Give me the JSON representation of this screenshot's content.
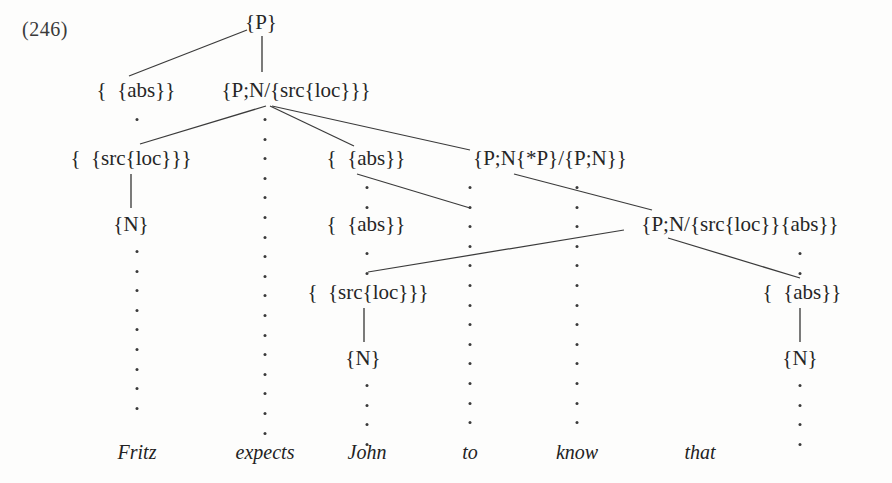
{
  "example": {
    "number": "(246)"
  },
  "sentence": {
    "words": [
      {
        "text": "Fritz",
        "x": 137,
        "y": 452
      },
      {
        "text": "expects",
        "x": 265,
        "y": 452
      },
      {
        "text": "John",
        "x": 367,
        "y": 452
      },
      {
        "text": "to",
        "x": 470,
        "y": 452
      },
      {
        "text": "know",
        "x": 577,
        "y": 452
      },
      {
        "text": "that",
        "x": 700,
        "y": 452
      }
    ]
  },
  "tree": {
    "nodes": [
      {
        "id": "n-root-p",
        "label": "{P}",
        "x": 261,
        "y": 22
      },
      {
        "id": "n-fritz-abs",
        "label": "{  {abs}}",
        "x": 136,
        "y": 90
      },
      {
        "id": "n-pn-srcloc",
        "label": "{P;N/{src{loc}}}",
        "x": 296,
        "y": 90
      },
      {
        "id": "n-fritz-srcloc",
        "label": "{  {src{loc}}}",
        "x": 131,
        "y": 158
      },
      {
        "id": "n-john-abs-1",
        "label": "{  {abs}}",
        "x": 366,
        "y": 158
      },
      {
        "id": "n-pn-starp",
        "label": "{P;N{*P}/{P;N}}",
        "x": 550,
        "y": 158
      },
      {
        "id": "n-fritz-n",
        "label": "{N}",
        "x": 131,
        "y": 224
      },
      {
        "id": "n-john-abs-2",
        "label": "{  {abs}}",
        "x": 366,
        "y": 224
      },
      {
        "id": "n-pn-srcloc-abs",
        "label": "{P;N/{src{loc}}{abs}}",
        "x": 740,
        "y": 224
      },
      {
        "id": "n-john-srcloc",
        "label": "{  {src{loc}}}",
        "x": 368,
        "y": 292
      },
      {
        "id": "n-that-abs",
        "label": "{  {abs}}",
        "x": 802,
        "y": 292
      },
      {
        "id": "n-john-n",
        "label": "{N}",
        "x": 363,
        "y": 358
      },
      {
        "id": "n-that-n",
        "label": "{N}",
        "x": 800,
        "y": 358
      }
    ],
    "edges": [
      {
        "id": "e-root-to-fritz-abs",
        "x1": 247,
        "y1": 30,
        "x2": 129,
        "y2": 76,
        "kind": "diagonal"
      },
      {
        "id": "e-root-to-pn-srcloc",
        "x1": 262,
        "y1": 36,
        "x2": 262,
        "y2": 72,
        "kind": "vertical"
      },
      {
        "id": "e-pnsrc-to-fritz-srcloc",
        "x1": 266,
        "y1": 106,
        "x2": 140,
        "y2": 144,
        "kind": "diagonal"
      },
      {
        "id": "e-pnsrc-to-john-abs",
        "x1": 270,
        "y1": 106,
        "x2": 354,
        "y2": 146,
        "kind": "diagonal"
      },
      {
        "id": "e-pnsrc-to-pn-starp",
        "x1": 272,
        "y1": 106,
        "x2": 470,
        "y2": 150,
        "kind": "diagonal"
      },
      {
        "id": "e-fritzsrc-to-fritz-n",
        "x1": 131,
        "y1": 174,
        "x2": 131,
        "y2": 208,
        "kind": "vertical"
      },
      {
        "id": "e-johnabs1-to-johnabs2",
        "x1": 357,
        "y1": 174,
        "x2": 470,
        "y2": 208,
        "kind": "diagonal"
      },
      {
        "id": "e-pnstarp-to-pnsrcabs",
        "x1": 514,
        "y1": 174,
        "x2": 652,
        "y2": 210,
        "kind": "diagonal"
      },
      {
        "id": "e-johnabs2-to-pnsrcabs",
        "x1": 368,
        "y1": 272,
        "x2": 624,
        "y2": 230,
        "kind": "diagonal"
      },
      {
        "id": "e-pnsrcabs-to-that-abs",
        "x1": 668,
        "y1": 238,
        "x2": 800,
        "y2": 278,
        "kind": "diagonal"
      },
      {
        "id": "e-johnsrc-to-john-n",
        "x1": 364,
        "y1": 308,
        "x2": 364,
        "y2": 342,
        "kind": "vertical"
      },
      {
        "id": "e-thatabs-to-that-n",
        "x1": 800,
        "y1": 308,
        "x2": 800,
        "y2": 342,
        "kind": "vertical"
      }
    ],
    "dotted_columns": [
      {
        "id": "dots-fritz-upper",
        "x": 137,
        "y": 118,
        "count": 1
      },
      {
        "id": "dots-fritz-lower",
        "x": 137,
        "y": 250,
        "count": 9
      },
      {
        "id": "dots-expects",
        "x": 265,
        "y": 118,
        "count": 17
      },
      {
        "id": "dots-john-a",
        "x": 367,
        "y": 186,
        "count": 2
      },
      {
        "id": "dots-john-b",
        "x": 367,
        "y": 252,
        "count": 2
      },
      {
        "id": "dots-john-c",
        "x": 367,
        "y": 384,
        "count": 4
      },
      {
        "id": "dots-to",
        "x": 470,
        "y": 186,
        "count": 13
      },
      {
        "id": "dots-know",
        "x": 577,
        "y": 186,
        "count": 13
      },
      {
        "id": "dots-that",
        "x": 800,
        "y": 252,
        "count": 2
      },
      {
        "id": "dots-that-lower",
        "x": 800,
        "y": 384,
        "count": 4
      }
    ]
  },
  "style": {
    "ink_color": "#2a2a2a",
    "line_color": "#3b3b3b",
    "page_color": "#fdfdfc"
  }
}
